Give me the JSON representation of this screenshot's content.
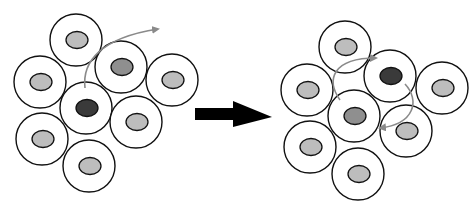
{
  "diagram": {
    "colors": {
      "cell_fill": "#ffffff",
      "cell_stroke": "#111111",
      "nucleus_light": "#bdbdbd",
      "nucleus_medium": "#8f8f8f",
      "nucleus_dark": "#3a3a3a",
      "arrow_gray": "#8a8a8a",
      "main_arrow": "#000000"
    },
    "before": {
      "label": "before",
      "cells": [
        {
          "id": "top",
          "cx": 76,
          "cy": 40,
          "r": 26,
          "nucleus": "light"
        },
        {
          "id": "upper-right",
          "cx": 121,
          "cy": 67,
          "r": 26,
          "nucleus": "medium"
        },
        {
          "id": "left",
          "cx": 40,
          "cy": 82,
          "r": 26,
          "nucleus": "light"
        },
        {
          "id": "center",
          "cx": 86,
          "cy": 108,
          "r": 26,
          "nucleus": "dark"
        },
        {
          "id": "far-right",
          "cx": 172,
          "cy": 80,
          "r": 26,
          "nucleus": "light"
        },
        {
          "id": "lower-right",
          "cx": 136,
          "cy": 122,
          "r": 26,
          "nucleus": "light"
        },
        {
          "id": "lower-left",
          "cx": 42,
          "cy": 139,
          "r": 26,
          "nucleus": "light"
        },
        {
          "id": "bottom",
          "cx": 89,
          "cy": 166,
          "r": 26,
          "nucleus": "light"
        }
      ]
    },
    "after": {
      "label": "after",
      "cells": [
        {
          "id": "top",
          "cx": 345,
          "cy": 47,
          "r": 26,
          "nucleus": "light"
        },
        {
          "id": "upper-right",
          "cx": 390,
          "cy": 76,
          "r": 26,
          "nucleus": "dark"
        },
        {
          "id": "left",
          "cx": 307,
          "cy": 90,
          "r": 26,
          "nucleus": "light"
        },
        {
          "id": "center",
          "cx": 354,
          "cy": 116,
          "r": 26,
          "nucleus": "medium"
        },
        {
          "id": "far-right",
          "cx": 442,
          "cy": 88,
          "r": 26,
          "nucleus": "light"
        },
        {
          "id": "lower-right",
          "cx": 406,
          "cy": 131,
          "r": 26,
          "nucleus": "light"
        },
        {
          "id": "lower-left",
          "cx": 310,
          "cy": 147,
          "r": 26,
          "nucleus": "light"
        },
        {
          "id": "bottom",
          "cx": 358,
          "cy": 174,
          "r": 26,
          "nucleus": "light"
        }
      ]
    },
    "transition_arrow": {
      "direction": "right"
    }
  }
}
